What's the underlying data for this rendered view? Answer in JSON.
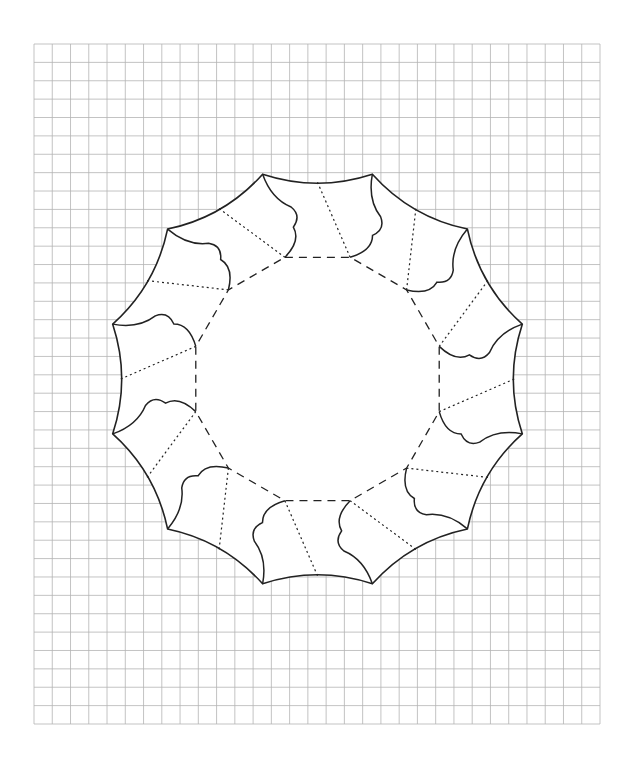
{
  "diagram": {
    "title": "",
    "background": "#ffffff",
    "grid": {
      "left": 34,
      "top": 44,
      "right": 600,
      "bottom": 724,
      "cols": 31,
      "rows": 37,
      "color": "#b4b4b4",
      "stroke_width": 0.8
    },
    "shape": {
      "center": [
        317.5,
        379
      ],
      "sides": 12,
      "start_angle_deg": -105,
      "outer_radius": 212,
      "outer_edge_sag": 9,
      "inner_radius": 126,
      "stroke_color": "#222222",
      "outer_stroke_width": 1.6,
      "flap_stroke_width": 1.5,
      "inner_dash": "8,6",
      "inner_stroke_width": 1.3,
      "fold_dash": "2,3",
      "fold_stroke_width": 1.2,
      "fold_outer_radius_offset": 8,
      "flap_profile": [
        {
          "to": [
            173,
            19
          ],
          "ctrl": [
            186,
            2
          ]
        },
        {
          "to": [
            153,
            16
          ],
          "ctrl": [
            162,
            27
          ]
        },
        {
          "to": [
            126,
            0
          ],
          "ctrl": [
            138,
            20
          ]
        }
      ]
    },
    "legend": {
      "solid_line": "cut line (outer edge and flaps)",
      "dashed_line": "fold line (inner dodecagon)",
      "dotted_line": "fold line (panel)"
    }
  }
}
